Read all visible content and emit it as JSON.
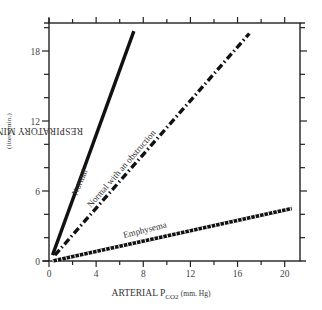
{
  "chart_data": {
    "type": "line",
    "title": "",
    "xlabel": "ARTERIAL P_CO2 (mm. Hg)",
    "ylabel": "RESPIRATORY MINUTE VOLUME (liters/min.)",
    "xlim": [
      0,
      21.3
    ],
    "ylim": [
      0,
      20.4
    ],
    "x_ticks": [
      0,
      4,
      8,
      12,
      16,
      20
    ],
    "y_ticks": [
      0,
      6,
      12,
      18
    ],
    "x_minor_step": 2,
    "y_minor_step": 2,
    "grid": false,
    "legend": "inline line labels",
    "series": [
      {
        "name": "Normal",
        "style": "solid",
        "x": [
          0.3,
          7.2
        ],
        "y": [
          0.5,
          19.7
        ]
      },
      {
        "name": "Normal with an obstruction",
        "style": "dash-dot",
        "x": [
          0.5,
          17.0
        ],
        "y": [
          0.5,
          19.5
        ]
      },
      {
        "name": "Emphysema",
        "style": "hatched",
        "x": [
          0.3,
          20.6
        ],
        "y": [
          0.0,
          4.5
        ]
      }
    ]
  },
  "labels": {
    "ylabel_main": "RESPIRATORY MINUTE VOLUME",
    "ylabel_unit": "(liters/min.)",
    "xlabel_main": "ARTERIAL P",
    "xlabel_sub": "CO2",
    "xlabel_unit": "(mm. Hg)",
    "series_normal": "Normal",
    "series_obstruction": "Normal with an obstruction",
    "series_emphysema": "Emphysema"
  }
}
